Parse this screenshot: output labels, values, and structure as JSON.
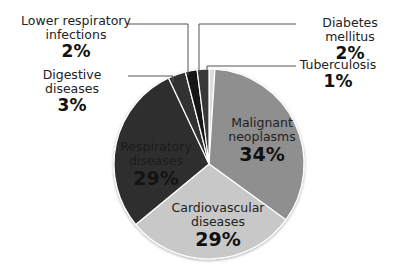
{
  "chart_data": {
    "type": "pie",
    "title": "",
    "start_angle": "12 o'clock, clockwise",
    "categories": [
      "Tuberculosis",
      "Malignant neoplasms",
      "Cardiovascular diseases",
      "Respiratory diseases",
      "Digestive diseases",
      "Lower respiratory infections",
      "Diabetes mellitus"
    ],
    "values": [
      1,
      34,
      29,
      29,
      3,
      2,
      2
    ],
    "colors": [
      "#dcdcdc",
      "#8f8f8f",
      "#c8c8c8",
      "#2f2f2f",
      "#333333",
      "#151515",
      "#383838"
    ],
    "legend": "none (callout labels)"
  },
  "labels": {
    "tb": {
      "name": "Tuberculosis",
      "pct": "1%"
    },
    "malignant": {
      "name1": "Malignant",
      "name2": "neoplasms",
      "pct": "34%"
    },
    "cardio": {
      "name1": "Cardiovascular",
      "name2": "diseases",
      "pct": "29%"
    },
    "respiratory": {
      "name1": "Respiratory",
      "name2": "diseases",
      "pct": "29%"
    },
    "digestive": {
      "name": "Digestive diseases",
      "pct": "3%"
    },
    "lower_resp": {
      "name1": "Lower respiratory",
      "name2": "infections",
      "pct": "2%"
    },
    "diabetes": {
      "name": "Diabetes mellitus",
      "pct": "2%"
    }
  }
}
